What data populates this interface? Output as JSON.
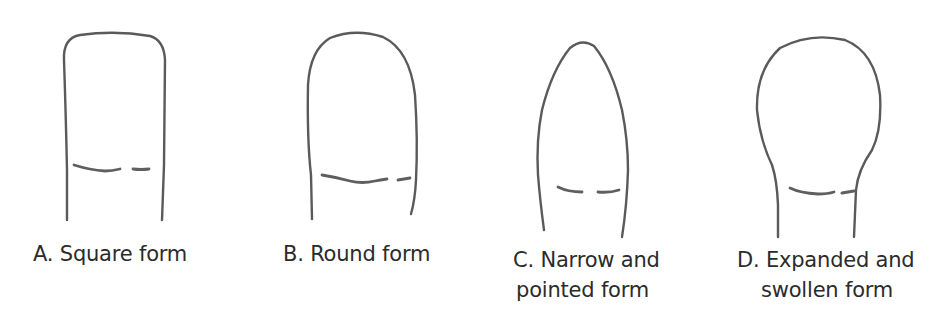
{
  "figure": {
    "stroke_color": "#5a5a5a",
    "text_color": "#2b2b2b",
    "background": "#ffffff",
    "panels": [
      {
        "id": "A",
        "label_lines": [
          "A. Square form"
        ]
      },
      {
        "id": "B",
        "label_lines": [
          "B. Round form"
        ]
      },
      {
        "id": "C",
        "label_lines": [
          "C. Narrow and",
          "pointed form"
        ]
      },
      {
        "id": "D",
        "label_lines": [
          "D. Expanded and",
          "swollen form"
        ]
      }
    ]
  }
}
